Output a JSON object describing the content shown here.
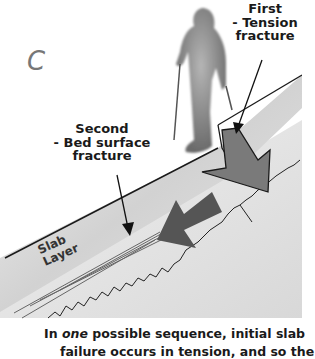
{
  "diagram": {
    "panel_letter": "C",
    "labels": {
      "first_fracture": [
        "First",
        "- Tension",
        "fracture"
      ],
      "second_fracture": [
        "Second",
        "- Bed surface",
        "fracture"
      ],
      "slab_layer": [
        "Slab",
        "Layer"
      ]
    },
    "caption": {
      "prefix": "In ",
      "emphasis": "one",
      "rest": " possible sequence, initial slab",
      "second_line_partial": "failure occurs in tension, and so the"
    },
    "colors": {
      "background": "#ffffff",
      "slab_fill": "#d9d9d9",
      "arrow_dark": "#555555",
      "arrow_medium": "#7a7a7a",
      "figure": "#8a8a8a",
      "line": "#1a1a1a"
    }
  }
}
